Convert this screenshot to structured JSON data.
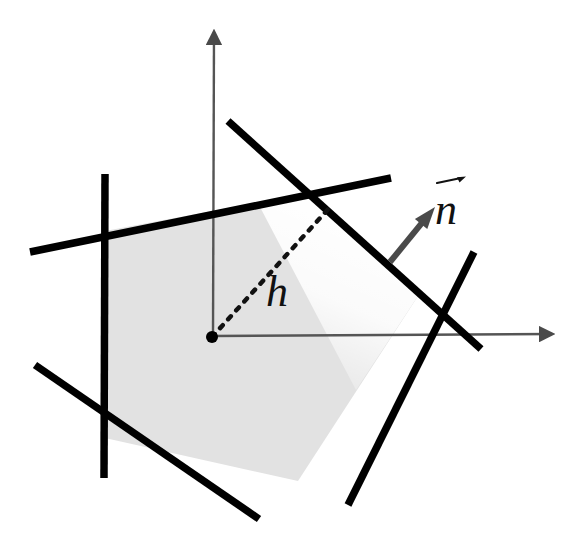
{
  "figure": {
    "kind": "geometry-diagram",
    "background_color": "#ffffff",
    "fill_color": "#e2e2e2",
    "line_color": "#000000",
    "axis_color": "#555555",
    "vector_color": "#4a4a4a",
    "labels": {
      "h": "h",
      "n": "n",
      "n_accent": "⃗"
    },
    "axes": {
      "origin": {
        "x": 212,
        "y": 337
      },
      "x_axis": {
        "x1": 212,
        "y1": 336,
        "x2": 552,
        "y2": 334,
        "arrow": true
      },
      "y_axis": {
        "x1": 213,
        "y1": 337,
        "x2": 214,
        "y2": 32,
        "arrow": true
      },
      "stroke_width": 2.4
    },
    "origin_dot": {
      "cx": 212,
      "cy": 337,
      "r": 6
    },
    "dashed_segment": {
      "name": "support-distance-h",
      "x1": 212,
      "y1": 337,
      "x2": 331,
      "y2": 206,
      "dash": "4 8",
      "stroke_width": 4.5
    },
    "normal_vector": {
      "name": "outward-normal-n",
      "x1": 390,
      "y1": 262,
      "x2": 435,
      "y2": 207,
      "stroke_width": 6,
      "head_length": 22,
      "head_width": 16
    },
    "boundary_lines": [
      {
        "id": "line-left-vertical",
        "x1": 105,
        "y1": 174,
        "x2": 104,
        "y2": 478
      },
      {
        "id": "line-top-left",
        "x1": 30,
        "y1": 252,
        "x2": 391,
        "y2": 178
      },
      {
        "id": "line-upper-right",
        "x1": 228,
        "y1": 121,
        "x2": 481,
        "y2": 349
      },
      {
        "id": "line-right-descend",
        "x1": 474,
        "y1": 252,
        "x2": 348,
        "y2": 505
      },
      {
        "id": "line-bottom-left",
        "x1": 35,
        "y1": 365,
        "x2": 259,
        "y2": 519
      }
    ],
    "line_stroke_width": 7.5,
    "polygon_vertices": [
      {
        "x": 105,
        "y": 231
      },
      {
        "x": 308,
        "y": 193
      },
      {
        "x": 420,
        "y": 293
      },
      {
        "x": 298,
        "y": 481
      },
      {
        "x": 105,
        "y": 438
      }
    ],
    "highlight_band": {
      "name": "glow-band-upper-right-edge",
      "color": "#ffffff",
      "opacity": 0.95,
      "points": "308,193 420,293 356,390 260,207"
    }
  }
}
